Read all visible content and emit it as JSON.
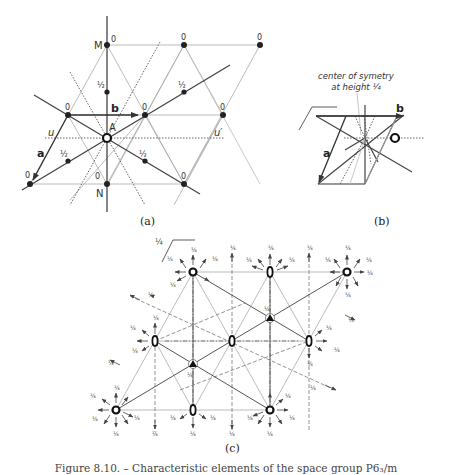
{
  "panel_a": {
    "caption": "(a)",
    "vector_a": "a",
    "vector_b": "b",
    "point_M": "M",
    "point_N": "N",
    "point_A": "A",
    "line_u": "u",
    "line_u_prime": "u′",
    "height_zero": "0",
    "height_half": "½"
  },
  "panel_b": {
    "caption": "(b)",
    "vector_a": "a",
    "vector_b": "b",
    "annotation_line1": "center of symetry",
    "annotation_line2": "at height ¼"
  },
  "panel_c": {
    "caption": "(c)",
    "height_quarter": "¼"
  },
  "figure_caption": "Figure 8.10. – Characteristic elements of the space group P6₃/m"
}
